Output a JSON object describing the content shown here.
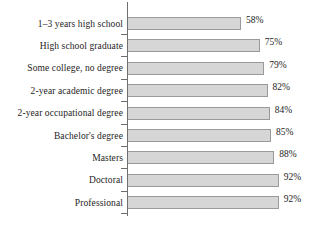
{
  "chart_data": {
    "type": "bar",
    "orientation": "horizontal",
    "title": "",
    "subtitle": "",
    "xlabel": "",
    "ylabel": "",
    "grid": false,
    "legend": false,
    "legend_position": "none",
    "value_suffix": "%",
    "xlim": [
      50,
      95
    ],
    "axis_line": true,
    "categories": [
      "1–3 years high school",
      "High school graduate",
      "Some college, no degree",
      "2-year academic degree",
      "2-year occupational degree",
      "Bachelor's degree",
      "Masters",
      "Doctoral",
      "Professional"
    ],
    "values": [
      58,
      75,
      79,
      82,
      84,
      85,
      88,
      92,
      92
    ],
    "value_labels": [
      "58%",
      "75%",
      "79%",
      "82%",
      "84%",
      "85%",
      "88%",
      "92%",
      "92%"
    ],
    "colors": {
      "bar_fill": "#d6d6d6",
      "bar_stroke": "#9a9a9a",
      "axis": "#6f6f6f",
      "text": "#242424",
      "background": "#ffffff"
    }
  }
}
